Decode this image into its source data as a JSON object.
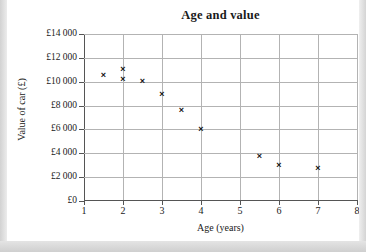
{
  "chart_data": {
    "type": "scatter",
    "title": "Age and value",
    "xlabel": "Age (years)",
    "ylabel": "Value of car (£)",
    "xlim": [
      1,
      8
    ],
    "ylim": [
      0,
      14000
    ],
    "grid": true,
    "legend": "none",
    "marker": "x",
    "xticks": [
      "1",
      "2",
      "3",
      "4",
      "5",
      "6",
      "7",
      "8"
    ],
    "xtick_values": [
      1,
      2,
      3,
      4,
      5,
      6,
      7,
      8
    ],
    "yticks": [
      "£0",
      "£2 000",
      "£4 000",
      "£6 000",
      "£8 000",
      "£10 000",
      "£12 000",
      "£14 000"
    ],
    "ytick_values": [
      0,
      2000,
      4000,
      6000,
      8000,
      10000,
      12000,
      14000
    ],
    "x": [
      1.5,
      2.0,
      2.0,
      2.5,
      3.0,
      3.5,
      4.0,
      5.5,
      6.0,
      7.0
    ],
    "y": [
      10500,
      11000,
      10200,
      10000,
      8900,
      7600,
      6000,
      3700,
      2950,
      2750
    ],
    "points": [
      {
        "x": 1.5,
        "y": 10500
      },
      {
        "x": 2.0,
        "y": 11000
      },
      {
        "x": 2.0,
        "y": 10200
      },
      {
        "x": 2.5,
        "y": 10000
      },
      {
        "x": 3.0,
        "y": 8900
      },
      {
        "x": 3.5,
        "y": 7600
      },
      {
        "x": 4.0,
        "y": 6000
      },
      {
        "x": 5.5,
        "y": 3700
      },
      {
        "x": 6.0,
        "y": 2950
      },
      {
        "x": 7.0,
        "y": 2750
      }
    ]
  },
  "colors": {
    "marker": "#111111",
    "grid": "#b3b3b3",
    "axis": "#555555",
    "text": "#1a1a1a",
    "page": "#ffffff",
    "scan_background": "#d9d9d9"
  }
}
